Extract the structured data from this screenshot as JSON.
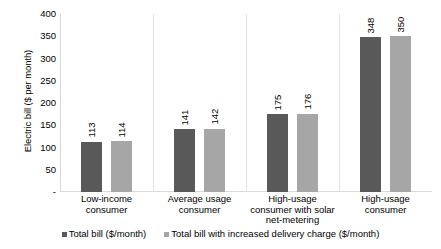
{
  "chart_data": {
    "type": "bar",
    "title": "",
    "xlabel": "",
    "ylabel": "Electric bill ($ per month)",
    "ylim": [
      0,
      400
    ],
    "yticks": [
      {
        "value": 400,
        "label": "400"
      },
      {
        "value": 350,
        "label": "350"
      },
      {
        "value": 300,
        "label": "300"
      },
      {
        "value": 250,
        "label": "250"
      },
      {
        "value": 200,
        "label": "200"
      },
      {
        "value": 150,
        "label": "150"
      },
      {
        "value": 100,
        "label": "100"
      },
      {
        "value": 50,
        "label": "50"
      },
      {
        "value": 0,
        "label": "-"
      }
    ],
    "grid": false,
    "legend_position": "bottom",
    "categories": [
      "Low-income consumer",
      "Average usage consumer",
      "High-usage consumer with solar net-metering",
      "High-usage consumer"
    ],
    "series": [
      {
        "name": "Total bill ($/month)",
        "color": "#595959",
        "values": [
          113,
          141,
          175,
          348
        ]
      },
      {
        "name": "Total bill with increased delivery charge ($/month)",
        "color": "#a6a6a6",
        "values": [
          114,
          142,
          176,
          350
        ]
      }
    ]
  }
}
